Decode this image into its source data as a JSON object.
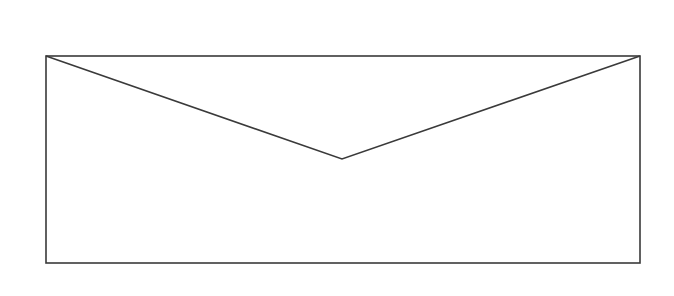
{
  "diagram": {
    "stroke_color": "#3a3a3a",
    "background_color": "#ffffff",
    "envelope": {
      "x": 46,
      "y": 56,
      "width": 594,
      "height": 207
    },
    "flap": {
      "left_corner": [
        46,
        56
      ],
      "apex": [
        342,
        159
      ],
      "right_corner": [
        640,
        56
      ]
    }
  }
}
